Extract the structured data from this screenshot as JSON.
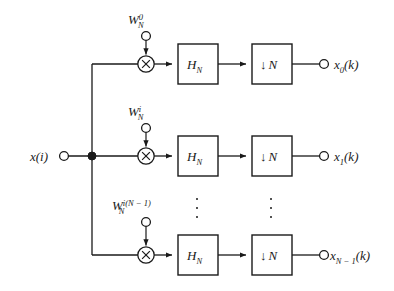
{
  "figure": {
    "type": "block-diagram",
    "domain": "signal-processing",
    "background_color": "#ffffff",
    "line_color": "#1a1a1a"
  },
  "input": {
    "label_base": "x",
    "label_arg": "(i)",
    "terminal": "open-circle"
  },
  "branches": [
    {
      "id": "branch-0",
      "weight": {
        "base": "W",
        "sub": "N",
        "sup": "0"
      },
      "multiplier": "×",
      "filter": {
        "base": "H",
        "sub": "N"
      },
      "decimator": {
        "arrow": "↓",
        "factor": "N"
      },
      "output": {
        "base": "x",
        "sub": "0",
        "arg": "(k)"
      }
    },
    {
      "id": "branch-i",
      "weight": {
        "base": "W",
        "sub": "N",
        "sup": "i"
      },
      "multiplier": "×",
      "filter": {
        "base": "H",
        "sub": "N"
      },
      "decimator": {
        "arrow": "↓",
        "factor": "N"
      },
      "output": {
        "base": "x",
        "sub": "1",
        "arg": "(k)"
      }
    },
    {
      "id": "branch-last",
      "weight": {
        "base": "W",
        "sub": "N",
        "sup": "i(N − 1)"
      },
      "multiplier": "×",
      "filter": {
        "base": "H",
        "sub": "N"
      },
      "decimator": {
        "arrow": "↓",
        "factor": "N"
      },
      "output": {
        "base": "x",
        "sub": "N − 1",
        "arg": "(k)"
      }
    }
  ],
  "ellipses": [
    {
      "id": "ellipsis-filter-column",
      "glyph": "⋮"
    },
    {
      "id": "ellipsis-decimator-column",
      "glyph": "⋮"
    }
  ]
}
